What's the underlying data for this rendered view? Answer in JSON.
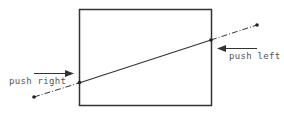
{
  "diagram": {
    "labels": {
      "push_right": "push right",
      "push_left": "push left"
    },
    "colors": {
      "stroke": "#333333",
      "text": "#555555",
      "background": "#ffffff"
    }
  }
}
